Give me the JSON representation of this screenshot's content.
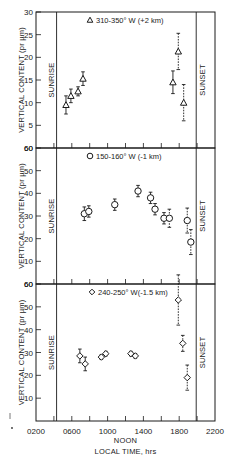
{
  "chart_data": [
    {
      "type": "scatter",
      "title": "310-350° W (+2 km)",
      "marker": "triangle",
      "xlabel": "LOCAL TIME, hrs",
      "ylabel": "VERTICAL CONTENT (pr µm)",
      "xlim": [
        2,
        22
      ],
      "ylim": [
        0,
        30
      ],
      "yticks": [
        5,
        10,
        15,
        20,
        25,
        30
      ],
      "annotations": [
        "SUNRISE",
        "SUNSET"
      ],
      "sunrise_hr": 4.3,
      "sunset_hr": 19.9,
      "points": [
        {
          "x": 5.35,
          "y": 9.5,
          "err": 2.0
        },
        {
          "x": 5.9,
          "y": 11.5,
          "err": 1.5
        },
        {
          "x": 6.7,
          "y": 12.5,
          "err": 1.0
        },
        {
          "x": 7.25,
          "y": 15.3,
          "err": 1.5
        },
        {
          "x": 17.3,
          "y": 14.5,
          "err": 2.5
        },
        {
          "x": 17.9,
          "y": 21.3,
          "err": 4.0
        },
        {
          "x": 18.5,
          "y": 10.0,
          "err": 4.0
        }
      ]
    },
    {
      "type": "scatter",
      "title": "150-160° W (-1 km)",
      "marker": "circle",
      "xlabel": "LOCAL TIME, hrs",
      "ylabel": "VERTICAL CONTENT (pr µm)",
      "xlim": [
        2,
        22
      ],
      "ylim": [
        0,
        60
      ],
      "yticks": [
        10,
        20,
        30,
        40,
        50,
        60
      ],
      "annotations": [
        "SUNRISE",
        "SUNSET"
      ],
      "sunrise_hr": 4.3,
      "sunset_hr": 19.9,
      "points": [
        {
          "x": 7.4,
          "y": 31,
          "err": 3.0
        },
        {
          "x": 7.9,
          "y": 32,
          "err": 2.5
        },
        {
          "x": 10.8,
          "y": 35,
          "err": 2.5
        },
        {
          "x": 13.4,
          "y": 41,
          "err": 2.5
        },
        {
          "x": 14.8,
          "y": 38,
          "err": 2.5
        },
        {
          "x": 15.3,
          "y": 33,
          "err": 2.5
        },
        {
          "x": 16.3,
          "y": 29,
          "err": 2.5
        },
        {
          "x": 16.9,
          "y": 29,
          "err": 4.0
        },
        {
          "x": 18.9,
          "y": 28,
          "err": 5.5
        },
        {
          "x": 19.3,
          "y": 18.5,
          "err": 5.5
        }
      ]
    },
    {
      "type": "scatter",
      "title": "240-250° W(-1.5 km)",
      "marker": "diamond",
      "xlabel": "LOCAL TIME, hrs",
      "ylabel": "VERTICAL CONTENT (pr µm)",
      "xlim": [
        2,
        22
      ],
      "ylim": [
        0,
        60
      ],
      "yticks": [
        10,
        20,
        30,
        40,
        50,
        60
      ],
      "xticks": [
        "0200",
        "0600",
        "1000",
        "1400",
        "1800",
        "2200"
      ],
      "x_annotation": "NOON",
      "annotations": [
        "SUNRISE",
        "SUNSET"
      ],
      "sunrise_hr": 4.3,
      "sunset_hr": 19.9,
      "points": [
        {
          "x": 6.9,
          "y": 28.5,
          "err": 3.0
        },
        {
          "x": 7.5,
          "y": 25,
          "err": 3.0
        },
        {
          "x": 9.3,
          "y": 28,
          "err": 1.0
        },
        {
          "x": 9.8,
          "y": 29.5,
          "err": 1.0
        },
        {
          "x": 12.6,
          "y": 29.5,
          "err": 1.0
        },
        {
          "x": 13.1,
          "y": 28.5,
          "err": 1.0
        },
        {
          "x": 17.9,
          "y": 53,
          "err": 11.0
        },
        {
          "x": 18.4,
          "y": 34,
          "err": 3.5
        },
        {
          "x": 18.9,
          "y": 19,
          "err": 5.5
        }
      ]
    }
  ],
  "labels": {
    "ylabel": "VERTICAL CONTENT (pr µm)",
    "sunrise": "SUNRISE",
    "sunset": "SUNSET",
    "noon": "NOON",
    "xlabel": "LOCAL TIME, hrs",
    "legend_top": "310-350° W (+2 km)",
    "legend_mid": "150-160° W (-1 km)",
    "legend_bot": "240-250° W(-1.5 km)"
  }
}
